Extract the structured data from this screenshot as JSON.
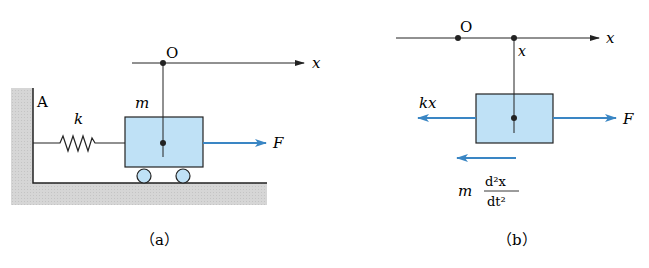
{
  "panels": [
    {
      "id": "a",
      "caption": "（a）",
      "labels": {
        "origin": "O",
        "axis": "x",
        "wall_point": "A",
        "spring": "k",
        "mass": "m",
        "force": "F"
      }
    },
    {
      "id": "b",
      "caption": "（b）",
      "labels": {
        "origin": "O",
        "axis": "x",
        "position": "x",
        "spring_force": "kx",
        "force": "F",
        "inertial_coef": "m",
        "inertial_num": "d²x",
        "inertial_den": "dt²"
      }
    }
  ],
  "colors": {
    "box_fill": "#bfe1f6",
    "arrow": "#3a86c4",
    "ground": "#d3d3d3",
    "line": "#222222"
  }
}
